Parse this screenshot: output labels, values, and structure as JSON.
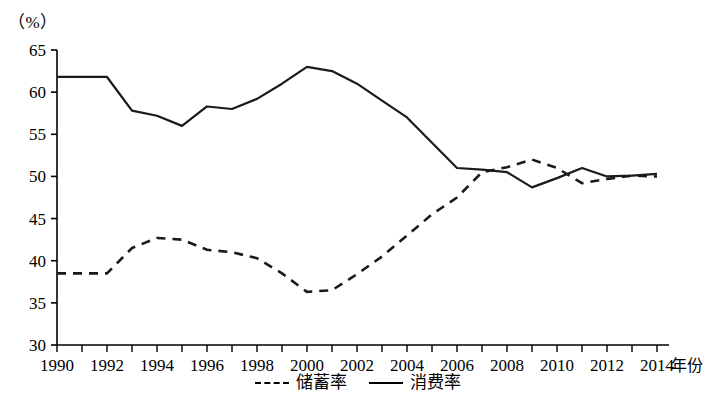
{
  "unit_label": "（%）",
  "axis": {
    "x_title": "年份",
    "y_ticks": [
      65,
      60,
      55,
      50,
      45,
      40,
      35,
      30
    ],
    "x_ticks": [
      1990,
      1992,
      1994,
      1996,
      1998,
      2000,
      2002,
      2004,
      2006,
      2008,
      2010,
      2012,
      2014
    ]
  },
  "legend": {
    "items": [
      {
        "label": "储蓄率",
        "style": "dashed"
      },
      {
        "label": "消费率",
        "style": "solid"
      }
    ]
  },
  "colors": {
    "line": "#1a1a1a",
    "axis": "#000000",
    "background": "#ffffff"
  },
  "chart_data": {
    "type": "line",
    "title": "",
    "xlabel": "年份",
    "ylabel": "（%）",
    "xlim": [
      1990,
      2014
    ],
    "ylim": [
      30,
      65
    ],
    "grid": false,
    "legend_position": "bottom-center",
    "x": [
      1990,
      1991,
      1992,
      1993,
      1994,
      1995,
      1996,
      1997,
      1998,
      1999,
      2000,
      2001,
      2002,
      2003,
      2004,
      2005,
      2006,
      2007,
      2008,
      2009,
      2010,
      2011,
      2012,
      2013,
      2014
    ],
    "series": [
      {
        "name": "储蓄率",
        "style": "dashed",
        "values": [
          38.5,
          38.5,
          38.5,
          41.5,
          42.7,
          42.5,
          41.3,
          41.0,
          40.3,
          38.5,
          36.3,
          36.5,
          38.4,
          40.5,
          43.0,
          45.5,
          47.5,
          50.5,
          51.1,
          52.0,
          51.0,
          49.2,
          49.7,
          50.1,
          50.0
        ],
        "ylim": [
          30,
          65
        ]
      },
      {
        "name": "消费率",
        "style": "solid",
        "values": [
          61.8,
          61.8,
          61.8,
          57.8,
          57.2,
          56.0,
          58.3,
          58.0,
          59.2,
          61.0,
          63.0,
          62.5,
          61.0,
          59.0,
          57.0,
          54.0,
          51.0,
          50.8,
          50.5,
          48.7,
          49.8,
          51.0,
          50.0,
          50.1,
          50.3
        ],
        "ylim": [
          30,
          65
        ]
      }
    ]
  }
}
